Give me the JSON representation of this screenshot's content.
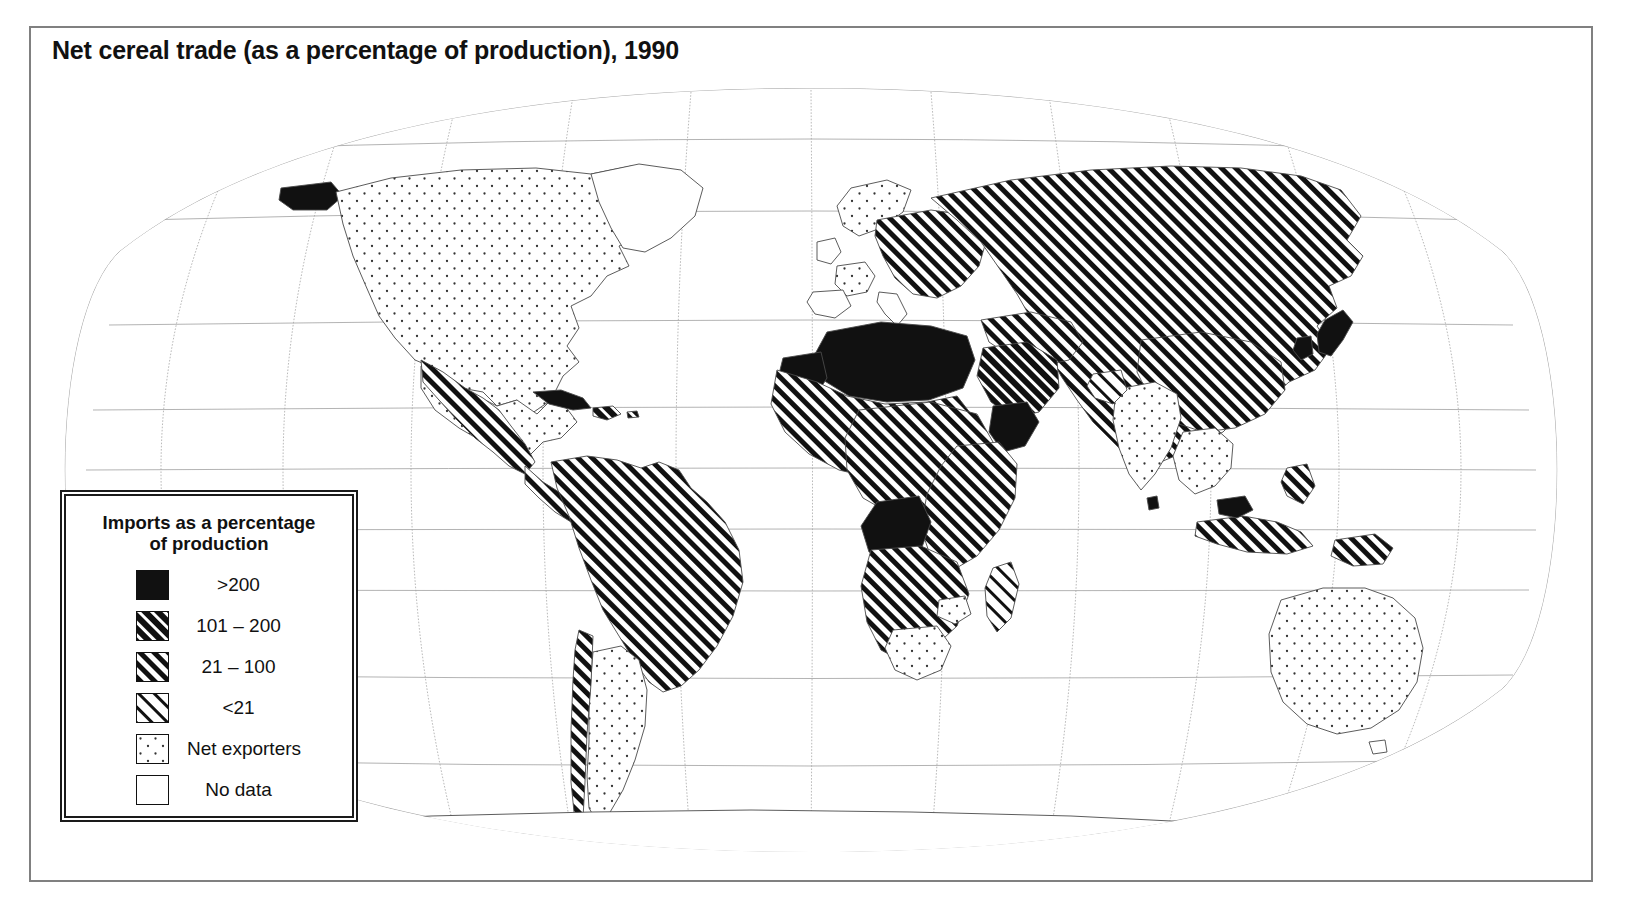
{
  "figure": {
    "title": "Net cereal trade (as a percentage of production), 1990",
    "type": "choropleth-world-map",
    "projection": "oval (Robinson-like) pseudocylindrical"
  },
  "legend": {
    "title_line1": "Imports as a percentage",
    "title_line2": "of production",
    "items": [
      {
        "label": ">200",
        "pattern": "solid-black",
        "swatch_name": "swatch-over-200"
      },
      {
        "label": "101 – 200",
        "pattern": "hatch-dense",
        "swatch_name": "swatch-101-200"
      },
      {
        "label": "21 – 100",
        "pattern": "hatch-medium",
        "swatch_name": "swatch-21-100"
      },
      {
        "label": "<21",
        "pattern": "hatch-light",
        "swatch_name": "swatch-under-21"
      },
      {
        "label": "Net exporters",
        "pattern": "dotted",
        "swatch_name": "swatch-net-exporters"
      },
      {
        "label": "No data",
        "pattern": "blank-white",
        "swatch_name": "swatch-no-data"
      }
    ]
  },
  "colors": {
    "ink": "#111111",
    "frame": "#808080",
    "graticule": "#9a9a9a",
    "coastline": "#555555",
    "background": "#ffffff"
  },
  "map_data": {
    "categories": [
      ">200",
      "101 - 200",
      "21 - 100",
      "<21",
      "Net exporters",
      "No data"
    ],
    "regions": [
      {
        "name": "Canada",
        "class": "Net exporters"
      },
      {
        "name": "United States",
        "class": "Net exporters"
      },
      {
        "name": "Alaska",
        "class": ">200"
      },
      {
        "name": "Greenland",
        "class": "No data"
      },
      {
        "name": "Mexico",
        "class": "21 - 100"
      },
      {
        "name": "Central America",
        "class": "21 - 100"
      },
      {
        "name": "Cuba",
        "class": ">200"
      },
      {
        "name": "Caribbean islands",
        "class": "101 - 200"
      },
      {
        "name": "Colombia",
        "class": "21 - 100"
      },
      {
        "name": "Venezuela",
        "class": "101 - 200"
      },
      {
        "name": "Brazil",
        "class": "21 - 100"
      },
      {
        "name": "Peru",
        "class": "21 - 100"
      },
      {
        "name": "Bolivia",
        "class": "21 - 100"
      },
      {
        "name": "Chile",
        "class": "21 - 100"
      },
      {
        "name": "Argentina",
        "class": "Net exporters"
      },
      {
        "name": "Uruguay",
        "class": "Net exporters"
      },
      {
        "name": "France",
        "class": "Net exporters"
      },
      {
        "name": "Scandinavia",
        "class": "Net exporters"
      },
      {
        "name": "United Kingdom",
        "class": "No data"
      },
      {
        "name": "Spain / Italy",
        "class": "No data"
      },
      {
        "name": "Eastern Europe",
        "class": "21 - 100"
      },
      {
        "name": "Russia / former USSR",
        "class": "21 - 100"
      },
      {
        "name": "Morocco / West Africa",
        "class": "21 - 100"
      },
      {
        "name": "Algeria",
        "class": ">200"
      },
      {
        "name": "Libya",
        "class": ">200"
      },
      {
        "name": "Egypt",
        "class": ">200"
      },
      {
        "name": "Mauritania",
        "class": ">200"
      },
      {
        "name": "Sahel states",
        "class": "21 - 100"
      },
      {
        "name": "Somalia / Djibouti",
        "class": ">200"
      },
      {
        "name": "East Africa",
        "class": "21 - 100"
      },
      {
        "name": "Angola / Congo",
        "class": ">200"
      },
      {
        "name": "Southern Africa",
        "class": "21 - 100"
      },
      {
        "name": "South Africa",
        "class": "Net exporters"
      },
      {
        "name": "Zimbabwe",
        "class": "Net exporters"
      },
      {
        "name": "Madagascar",
        "class": "<21"
      },
      {
        "name": "Arabian Peninsula",
        "class": "101 - 200"
      },
      {
        "name": "Middle East",
        "class": "21 - 100"
      },
      {
        "name": "India",
        "class": "Net exporters"
      },
      {
        "name": "Pakistan",
        "class": "<21"
      },
      {
        "name": "China",
        "class": "21 - 100"
      },
      {
        "name": "Mongolia",
        "class": "21 - 100"
      },
      {
        "name": "Japan",
        "class": ">200"
      },
      {
        "name": "Korea",
        "class": ">200"
      },
      {
        "name": "Southeast Asia",
        "class": "Net exporters"
      },
      {
        "name": "Indonesia",
        "class": "21 - 100"
      },
      {
        "name": "Malaysia",
        "class": ">200"
      },
      {
        "name": "Philippines",
        "class": "21 - 100"
      },
      {
        "name": "Papua New Guinea",
        "class": "21 - 100"
      },
      {
        "name": "Australia",
        "class": "Net exporters"
      },
      {
        "name": "New Zealand",
        "class": ">200"
      },
      {
        "name": "Antarctica",
        "class": "No data"
      }
    ]
  },
  "graticule": {
    "parallels_deg": [
      75,
      60,
      45,
      30,
      15,
      0,
      -15,
      -30,
      -45,
      -60,
      -75
    ],
    "meridians_deg": [
      -180,
      -150,
      -120,
      -90,
      -60,
      -30,
      0,
      30,
      60,
      90,
      120,
      150,
      180
    ]
  }
}
